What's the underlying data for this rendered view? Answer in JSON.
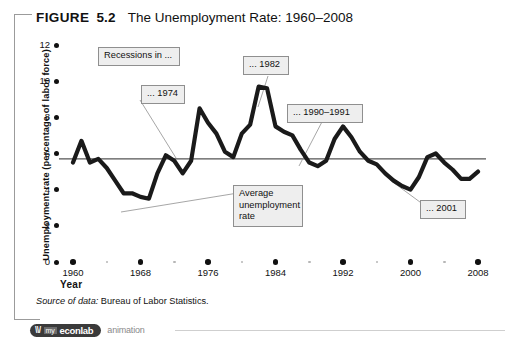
{
  "figure": {
    "label": "FIGURE",
    "number": "5.2",
    "title": "The Unemployment Rate: 1960–2008",
    "source_lead": "Source of data:",
    "source_body": " Bureau of Labor Statistics."
  },
  "media_bar": {
    "brand_mark": "\\\\/",
    "brand_prefix": "my",
    "brand_name": "econlab",
    "kind": "animation"
  },
  "chart_data": {
    "type": "line",
    "title": "The Unemployment Rate: 1960–2008",
    "xlabel": "Year",
    "ylabel": "Unemployment rate (percentage of labor force)",
    "xlim": [
      1960,
      2008
    ],
    "ylim": [
      0,
      12
    ],
    "grid": false,
    "legend": "none",
    "x_ticks": [
      1960,
      1968,
      1976,
      1984,
      1992,
      2000,
      2008
    ],
    "x_minor_ticks": [
      1964,
      1972,
      1980,
      1988,
      1996,
      2004
    ],
    "y_ticks": [
      0,
      2,
      4,
      6,
      8,
      10,
      12
    ],
    "series": [
      {
        "name": "Unemployment rate",
        "color": "#1a1a1a",
        "x": [
          1960,
          1961,
          1962,
          1963,
          1964,
          1965,
          1966,
          1967,
          1968,
          1969,
          1970,
          1971,
          1972,
          1973,
          1974,
          1975,
          1976,
          1977,
          1978,
          1979,
          1980,
          1981,
          1982,
          1983,
          1984,
          1985,
          1986,
          1987,
          1988,
          1989,
          1990,
          1991,
          1992,
          1993,
          1994,
          1995,
          1996,
          1997,
          1998,
          1999,
          2000,
          2001,
          2002,
          2003,
          2004,
          2005,
          2006,
          2007,
          2008
        ],
        "values": [
          5.5,
          6.7,
          5.5,
          5.7,
          5.2,
          4.5,
          3.8,
          3.8,
          3.6,
          3.5,
          4.9,
          5.9,
          5.6,
          4.9,
          5.6,
          8.5,
          7.7,
          7.1,
          6.1,
          5.8,
          7.1,
          7.6,
          9.7,
          9.6,
          7.5,
          7.2,
          7.0,
          6.2,
          5.5,
          5.3,
          5.6,
          6.8,
          7.5,
          6.9,
          6.1,
          5.6,
          5.4,
          4.9,
          4.5,
          4.2,
          4.0,
          4.7,
          5.8,
          6.0,
          5.5,
          5.1,
          4.6,
          4.6,
          5.0
        ]
      }
    ],
    "reference_line": {
      "name": "Average unemployment rate",
      "value": 5.7,
      "color": "#555555"
    },
    "annotations": [
      {
        "id": "recessions",
        "text": "Recessions in ..."
      },
      {
        "id": "rec-1974",
        "text": "... 1974"
      },
      {
        "id": "rec-1982",
        "text": "... 1982"
      },
      {
        "id": "rec-1990",
        "text": "... 1990–1991"
      },
      {
        "id": "rec-2001",
        "text": "... 2001"
      },
      {
        "id": "avg-rate",
        "text": "Average unemployment rate"
      }
    ]
  }
}
